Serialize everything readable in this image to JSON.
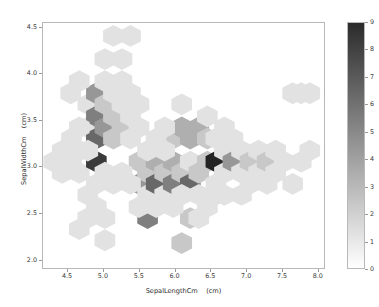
{
  "figure": {
    "background": "#ffffff",
    "width": 379,
    "height": 307
  },
  "chart_data": {
    "type": "heatmap",
    "subtype": "hexbin",
    "title": "",
    "xlabel": "SepalLengthCm    (cm)",
    "ylabel": "SepalWidthCm    (cm)",
    "xlim": [
      4.15,
      8.1
    ],
    "ylim": [
      1.9,
      4.55
    ],
    "xticks": [
      4.5,
      5.0,
      5.5,
      6.0,
      6.5,
      7.0,
      7.5,
      8.0
    ],
    "xticklabels": [
      "4.5",
      "5.0",
      "5.5",
      "6.0",
      "6.5",
      "7.0",
      "7.5",
      "8.0"
    ],
    "yticks": [
      2.0,
      2.5,
      3.0,
      3.5,
      4.0,
      4.5
    ],
    "yticklabels": [
      "2.0",
      "2.5",
      "3.0",
      "3.5",
      "4.0",
      "4.5"
    ],
    "grid": false,
    "colormap": "Greys",
    "colorbar": {
      "vmin": 0,
      "vmax": 9,
      "ticks": [
        0,
        1,
        2,
        3,
        4,
        5,
        6,
        7,
        8,
        9
      ],
      "ticklabels": [
        "0",
        "1",
        "2",
        "3",
        "4",
        "5",
        "6",
        "7",
        "8",
        "9"
      ],
      "position": "right",
      "low_color": "#ffffff",
      "high_color": "#2b2b2b"
    },
    "gridsize": 14,
    "hex_radius_x": 0.145,
    "hex_radius_y": 0.118,
    "bins": [
      {
        "x": 4.3,
        "y": 3.05,
        "count": 1
      },
      {
        "x": 4.42,
        "y": 3.17,
        "count": 1
      },
      {
        "x": 4.42,
        "y": 2.93,
        "count": 1
      },
      {
        "x": 4.55,
        "y": 3.3,
        "count": 1
      },
      {
        "x": 4.55,
        "y": 3.05,
        "count": 1
      },
      {
        "x": 4.66,
        "y": 3.17,
        "count": 1
      },
      {
        "x": 4.66,
        "y": 2.93,
        "count": 1
      },
      {
        "x": 4.78,
        "y": 3.42,
        "count": 1
      },
      {
        "x": 4.78,
        "y": 3.67,
        "count": 1
      },
      {
        "x": 4.9,
        "y": 3.79,
        "count": 4
      },
      {
        "x": 4.9,
        "y": 3.54,
        "count": 5
      },
      {
        "x": 4.9,
        "y": 3.3,
        "count": 6
      },
      {
        "x": 4.9,
        "y": 3.05,
        "count": 8
      },
      {
        "x": 5.02,
        "y": 3.42,
        "count": 4
      },
      {
        "x": 5.02,
        "y": 3.67,
        "count": 2
      },
      {
        "x": 5.02,
        "y": 3.92,
        "count": 1
      },
      {
        "x": 5.02,
        "y": 4.16,
        "count": 1
      },
      {
        "x": 5.14,
        "y": 3.54,
        "count": 2
      },
      {
        "x": 5.14,
        "y": 3.3,
        "count": 2
      },
      {
        "x": 5.14,
        "y": 3.79,
        "count": 1
      },
      {
        "x": 5.14,
        "y": 4.41,
        "count": 1
      },
      {
        "x": 5.26,
        "y": 3.42,
        "count": 2
      },
      {
        "x": 5.26,
        "y": 3.67,
        "count": 1
      },
      {
        "x": 5.26,
        "y": 3.92,
        "count": 1
      },
      {
        "x": 5.26,
        "y": 4.16,
        "count": 1
      },
      {
        "x": 5.38,
        "y": 3.54,
        "count": 1
      },
      {
        "x": 5.38,
        "y": 3.3,
        "count": 1
      },
      {
        "x": 5.38,
        "y": 3.79,
        "count": 1
      },
      {
        "x": 5.5,
        "y": 3.42,
        "count": 1
      },
      {
        "x": 5.5,
        "y": 3.05,
        "count": 2
      },
      {
        "x": 5.5,
        "y": 2.81,
        "count": 4
      },
      {
        "x": 5.62,
        "y": 2.93,
        "count": 2
      },
      {
        "x": 5.62,
        "y": 2.44,
        "count": 5
      },
      {
        "x": 5.62,
        "y": 2.69,
        "count": 1
      },
      {
        "x": 5.74,
        "y": 3.05,
        "count": 3
      },
      {
        "x": 5.74,
        "y": 2.81,
        "count": 6
      },
      {
        "x": 5.86,
        "y": 2.93,
        "count": 2
      },
      {
        "x": 5.86,
        "y": 2.69,
        "count": 1
      },
      {
        "x": 5.98,
        "y": 3.05,
        "count": 3
      },
      {
        "x": 5.98,
        "y": 2.81,
        "count": 5
      },
      {
        "x": 5.98,
        "y": 3.3,
        "count": 2
      },
      {
        "x": 6.1,
        "y": 3.42,
        "count": 3
      },
      {
        "x": 6.1,
        "y": 2.93,
        "count": 2
      },
      {
        "x": 6.1,
        "y": 2.17,
        "count": 2
      },
      {
        "x": 6.22,
        "y": 3.3,
        "count": 3
      },
      {
        "x": 6.22,
        "y": 3.05,
        "count": 1
      },
      {
        "x": 6.22,
        "y": 2.81,
        "count": 6
      },
      {
        "x": 6.22,
        "y": 2.44,
        "count": 2
      },
      {
        "x": 6.34,
        "y": 3.42,
        "count": 3
      },
      {
        "x": 6.34,
        "y": 2.93,
        "count": 2
      },
      {
        "x": 6.34,
        "y": 2.69,
        "count": 1
      },
      {
        "x": 6.46,
        "y": 3.3,
        "count": 2
      },
      {
        "x": 6.46,
        "y": 3.05,
        "count": 2
      },
      {
        "x": 6.58,
        "y": 3.05,
        "count": 9
      },
      {
        "x": 6.58,
        "y": 3.3,
        "count": 1
      },
      {
        "x": 6.58,
        "y": 2.81,
        "count": 1
      },
      {
        "x": 6.7,
        "y": 2.93,
        "count": 1
      },
      {
        "x": 6.7,
        "y": 3.17,
        "count": 1
      },
      {
        "x": 6.82,
        "y": 3.05,
        "count": 4
      },
      {
        "x": 6.82,
        "y": 3.3,
        "count": 1
      },
      {
        "x": 6.94,
        "y": 3.17,
        "count": 1
      },
      {
        "x": 6.94,
        "y": 2.93,
        "count": 1
      },
      {
        "x": 7.06,
        "y": 3.05,
        "count": 2
      },
      {
        "x": 7.18,
        "y": 3.17,
        "count": 1
      },
      {
        "x": 7.18,
        "y": 2.93,
        "count": 1
      },
      {
        "x": 7.3,
        "y": 3.05,
        "count": 2
      },
      {
        "x": 7.42,
        "y": 3.17,
        "count": 1
      },
      {
        "x": 7.42,
        "y": 2.93,
        "count": 1
      },
      {
        "x": 7.54,
        "y": 3.05,
        "count": 1
      },
      {
        "x": 7.66,
        "y": 2.81,
        "count": 1
      },
      {
        "x": 7.66,
        "y": 3.79,
        "count": 1
      },
      {
        "x": 7.78,
        "y": 3.79,
        "count": 1
      },
      {
        "x": 7.78,
        "y": 3.05,
        "count": 1
      },
      {
        "x": 7.9,
        "y": 3.79,
        "count": 1
      },
      {
        "x": 7.9,
        "y": 3.17,
        "count": 1
      },
      {
        "x": 4.78,
        "y": 3.17,
        "count": 1
      },
      {
        "x": 4.66,
        "y": 3.42,
        "count": 1
      },
      {
        "x": 5.5,
        "y": 3.67,
        "count": 1
      },
      {
        "x": 5.74,
        "y": 3.3,
        "count": 1
      },
      {
        "x": 5.86,
        "y": 3.42,
        "count": 1
      },
      {
        "x": 5.38,
        "y": 2.81,
        "count": 1
      },
      {
        "x": 5.26,
        "y": 2.93,
        "count": 1
      },
      {
        "x": 5.14,
        "y": 2.81,
        "count": 1
      },
      {
        "x": 5.02,
        "y": 2.93,
        "count": 1
      },
      {
        "x": 4.9,
        "y": 2.81,
        "count": 1
      },
      {
        "x": 4.78,
        "y": 2.69,
        "count": 1
      },
      {
        "x": 4.9,
        "y": 2.56,
        "count": 1
      },
      {
        "x": 5.02,
        "y": 2.44,
        "count": 1
      },
      {
        "x": 4.78,
        "y": 2.44,
        "count": 1
      },
      {
        "x": 4.66,
        "y": 2.32,
        "count": 1
      },
      {
        "x": 5.02,
        "y": 2.2,
        "count": 1
      },
      {
        "x": 5.5,
        "y": 2.56,
        "count": 1
      },
      {
        "x": 5.74,
        "y": 2.56,
        "count": 1
      },
      {
        "x": 5.98,
        "y": 2.56,
        "count": 1
      },
      {
        "x": 6.1,
        "y": 2.69,
        "count": 1
      },
      {
        "x": 6.34,
        "y": 2.44,
        "count": 1
      },
      {
        "x": 6.46,
        "y": 2.56,
        "count": 1
      },
      {
        "x": 6.58,
        "y": 2.69,
        "count": 1
      },
      {
        "x": 6.7,
        "y": 2.69,
        "count": 1
      },
      {
        "x": 6.94,
        "y": 2.69,
        "count": 1
      },
      {
        "x": 7.3,
        "y": 2.81,
        "count": 1
      },
      {
        "x": 7.06,
        "y": 2.81,
        "count": 1
      },
      {
        "x": 5.62,
        "y": 3.17,
        "count": 1
      },
      {
        "x": 5.86,
        "y": 3.17,
        "count": 1
      },
      {
        "x": 6.46,
        "y": 3.54,
        "count": 1
      },
      {
        "x": 6.1,
        "y": 3.67,
        "count": 1
      },
      {
        "x": 6.7,
        "y": 3.42,
        "count": 1
      },
      {
        "x": 4.54,
        "y": 3.79,
        "count": 1
      },
      {
        "x": 4.66,
        "y": 3.92,
        "count": 1
      },
      {
        "x": 5.38,
        "y": 4.41,
        "count": 1
      }
    ]
  }
}
